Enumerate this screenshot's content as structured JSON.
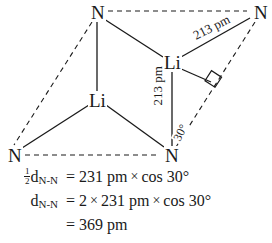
{
  "diagram": {
    "type": "molecular-structure-skeleton",
    "atoms": [
      {
        "id": "n-top-left",
        "element": "N",
        "x": 96,
        "y": 12
      },
      {
        "id": "n-top-right",
        "element": "N",
        "x": 259,
        "y": 12
      },
      {
        "id": "li-upper-right",
        "element": "Li",
        "x": 172,
        "y": 62
      },
      {
        "id": "li-lower-left",
        "element": "Li",
        "x": 97,
        "y": 100
      },
      {
        "id": "n-bottom-left",
        "element": "N",
        "x": 13,
        "y": 155
      },
      {
        "id": "n-bottom-right",
        "element": "N",
        "x": 170,
        "y": 155
      }
    ],
    "labels": {
      "bond_diagonal": "213 pm",
      "bond_vertical": "213 pm",
      "angle": "30°"
    },
    "colors": {
      "line": "#1a1a1a",
      "text": "#1a1a1a",
      "background": "#ffffff"
    }
  },
  "equations": {
    "line1": {
      "frac_num": "1",
      "frac_den": "2",
      "symbol": "d",
      "subscript": "N-N",
      "equals": "=",
      "value": "231 pm",
      "times": "×",
      "trig": "cos 30°"
    },
    "line2": {
      "symbol": "d",
      "subscript": "N-N",
      "equals": "=",
      "factor": "2",
      "times1": "×",
      "value": "231 pm",
      "times2": "×",
      "trig": "cos 30°"
    },
    "line3": {
      "equals": "=",
      "result": "369 pm"
    }
  }
}
